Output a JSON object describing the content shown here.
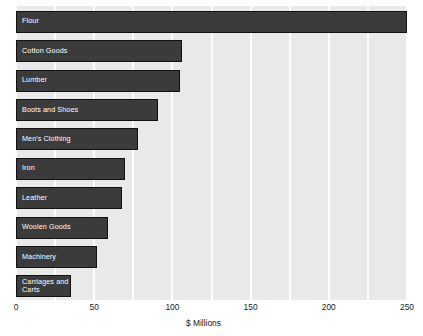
{
  "chart_data": {
    "type": "bar",
    "orientation": "horizontal",
    "title": "",
    "xlabel": "$ Millions",
    "ylabel": "",
    "categories": [
      "Flour",
      "Cotton Goods",
      "Lumber",
      "Boots and Shoes",
      "Men's Clothing",
      "Iron",
      "Leather",
      "Woolen Goods",
      "Machinery",
      "Carriages and Carts"
    ],
    "values": [
      250,
      106,
      105,
      91,
      78,
      70,
      68,
      59,
      52,
      35
    ],
    "xlim": [
      0,
      250
    ],
    "xticks": [
      0,
      50,
      100,
      150,
      200,
      250
    ],
    "xtick_labels": [
      "0",
      "50",
      "100",
      "150",
      "200",
      "250"
    ],
    "gridlines_x": [
      0,
      25,
      50,
      75,
      100,
      125,
      150,
      175,
      200,
      225,
      250
    ],
    "grid": true,
    "legend": false,
    "bar_color": "#3b3b3b",
    "bar_edge_color": "#111111",
    "plot_background": "#e9e9e9",
    "gridline_color": "#fdfdfd",
    "label_color": "#ffffff",
    "axis_text_color": "#1a1a1a"
  }
}
